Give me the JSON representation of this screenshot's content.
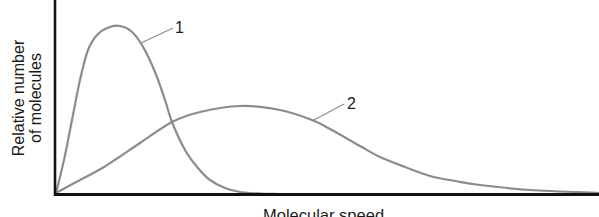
{
  "chart_data": {
    "type": "line",
    "title": "",
    "xlabel": "Molecular speed",
    "ylabel": "Relative number of molecules",
    "ylabel_lines": [
      "Relative number",
      "of molecules"
    ],
    "grid": false,
    "ticks": false,
    "legend": "none (curves labeled inline)",
    "series": [
      {
        "name": "1",
        "description": "Narrow, tall distribution peaking at low speed",
        "points_px": [
          [
            56,
            193
          ],
          [
            64,
            160
          ],
          [
            72,
            120
          ],
          [
            80,
            80
          ],
          [
            88,
            50
          ],
          [
            98,
            34
          ],
          [
            110,
            27
          ],
          [
            120,
            26
          ],
          [
            131,
            31
          ],
          [
            142,
            45
          ],
          [
            155,
            72
          ],
          [
            165,
            100
          ],
          [
            172,
            122
          ],
          [
            185,
            150
          ],
          [
            198,
            168
          ],
          [
            210,
            180
          ],
          [
            225,
            188
          ],
          [
            240,
            192
          ],
          [
            260,
            193.5
          ],
          [
            280,
            194
          ]
        ],
        "peak": {
          "x_px": 120,
          "relative_height": 1.0
        }
      },
      {
        "name": "2",
        "description": "Broad, flat distribution peaking at higher speed",
        "points_px": [
          [
            56,
            193
          ],
          [
            80,
            180
          ],
          [
            104,
            167
          ],
          [
            140,
            143
          ],
          [
            172,
            122
          ],
          [
            200,
            112
          ],
          [
            240,
            106
          ],
          [
            280,
            110
          ],
          [
            312,
            120
          ],
          [
            330,
            129
          ],
          [
            360,
            146
          ],
          [
            380,
            157
          ],
          [
            405,
            167
          ],
          [
            430,
            176
          ],
          [
            455,
            181
          ],
          [
            480,
            185
          ],
          [
            530,
            190
          ],
          [
            599,
            193
          ]
        ],
        "peak": {
          "x_px": 240,
          "relative_height": 0.52
        }
      }
    ],
    "crossing_point_px": [
      172,
      122
    ],
    "annotations": [
      {
        "text": "1",
        "x_px": 177,
        "y_px": 20,
        "leader": [
          [
            141,
            43
          ],
          [
            173,
            28
          ]
        ]
      },
      {
        "text": "2",
        "x_px": 348,
        "y_px": 96,
        "leader": [
          [
            312,
            121
          ],
          [
            344,
            104
          ]
        ]
      }
    ],
    "axes": {
      "origin_px": [
        55,
        194
      ],
      "x_end_px": 599,
      "y_top_px": 0
    }
  },
  "labels": {
    "ylabel_line1": "Relative number",
    "ylabel_line2": "of molecules",
    "xlabel": "Molecular speed",
    "curve1": "1",
    "curve2": "2"
  },
  "colors": {
    "curve": "#8c8c8c",
    "axis": "#111111",
    "text": "#1a1a1a",
    "background": "#ffffff"
  }
}
